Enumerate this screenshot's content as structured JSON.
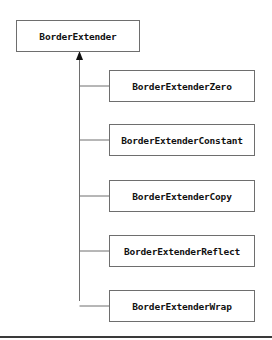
{
  "diagram": {
    "type": "class-hierarchy",
    "root": {
      "label": "BorderExtender"
    },
    "children": [
      {
        "label": "BorderExtenderZero"
      },
      {
        "label": "BorderExtenderConstant"
      },
      {
        "label": "BorderExtenderCopy"
      },
      {
        "label": "BorderExtenderReflect"
      },
      {
        "label": "BorderExtenderWrap"
      }
    ],
    "edges": [
      {
        "from": "BorderExtenderZero",
        "to": "BorderExtender",
        "relation": "inherits"
      },
      {
        "from": "BorderExtenderConstant",
        "to": "BorderExtender",
        "relation": "inherits"
      },
      {
        "from": "BorderExtenderCopy",
        "to": "BorderExtender",
        "relation": "inherits"
      },
      {
        "from": "BorderExtenderReflect",
        "to": "BorderExtender",
        "relation": "inherits"
      },
      {
        "from": "BorderExtenderWrap",
        "to": "BorderExtender",
        "relation": "inherits"
      }
    ],
    "colors": {
      "stroke": "#6e6e6e",
      "text": "#111111",
      "background": "#ffffff"
    }
  }
}
